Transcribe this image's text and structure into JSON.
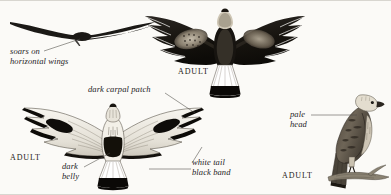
{
  "plate": {
    "subject": "rough-legged-hawk",
    "background_color": "#fbfaf7",
    "ink_color": "#1b1916",
    "border_color": "#d8d6d0"
  },
  "labels": {
    "soars_line1": "soars on",
    "soars_line2": "horizontal wings",
    "carpal": "dark carpal patch",
    "belly_line1": "dark",
    "belly_line2": "belly",
    "tail_line1": "white tail",
    "tail_line2": "black band",
    "head_line1": "pale",
    "head_line2": "head"
  },
  "adult_labels": {
    "upper": "ADULT",
    "lower_left": "ADULT",
    "lower_right": "ADULT"
  },
  "figures": {
    "silhouette": "soaring-hawk-silhouette",
    "dorsal": "adult-dorsal-flight",
    "ventral": "adult-ventral-flight",
    "perched": "adult-perched"
  }
}
